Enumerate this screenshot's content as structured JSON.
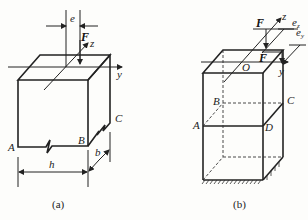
{
  "figure_a": {
    "caption": "(a)",
    "labels": {
      "force": "F",
      "axis_z": "z",
      "axis_y": "y",
      "eccentricity": "e",
      "corner_a": "A",
      "corner_b": "B",
      "corner_c": "C",
      "dim_h": "h",
      "dim_b": "b"
    }
  },
  "figure_b": {
    "caption": "(b)",
    "labels": {
      "force_top": "F",
      "force_mid": "F",
      "axis_z": "z",
      "axis_y": "y",
      "origin": "O",
      "ecc_z": "e",
      "ecc_z_sub": "z",
      "ecc_y": "e",
      "ecc_y_sub": "y",
      "corner_a": "A",
      "corner_b": "B",
      "corner_c": "C",
      "corner_d": "D"
    }
  }
}
